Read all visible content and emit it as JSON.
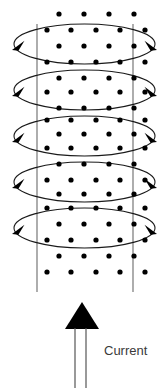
{
  "figure": {
    "background_color": "#ffffff",
    "width": 164,
    "height": 388
  },
  "labels": {
    "current": "Current"
  },
  "colors": {
    "coil_stroke": "#1a1a1a",
    "side_line": "#6b6b6b",
    "dot_fill": "#000000",
    "arrow_fill": "#000000",
    "current_shaft": "#555555",
    "label_text": "#3a3a3a"
  },
  "solenoid": {
    "loop_count": 5,
    "ellipse_center_x": 84.5,
    "ellipse_rx": 70.5,
    "ellipse_ry": 20,
    "loop_center_ys": [
      44,
      90,
      136,
      182,
      228
    ],
    "left_vertical_line_x": 37,
    "right_vertical_line_x": 133,
    "vertical_line_top_y": 24,
    "vertical_line_bottom_y": 292
  },
  "arrowheads": {
    "left_direction": "down-left",
    "right_direction": "down-right",
    "size": 11,
    "description": "Each coil loop carries one arrowhead on its left edge and one on its right edge indicating current circulation direction"
  },
  "field_dots": {
    "meaning": "magnetic field out of the page",
    "radius": 2.6,
    "rows": [
      {
        "y": 14,
        "xs": [
          59,
          84,
          109,
          134
        ]
      },
      {
        "y": 30,
        "xs": [
          47,
          71,
          96,
          120,
          145
        ]
      },
      {
        "y": 46,
        "xs": [
          59,
          84,
          109,
          134
        ]
      },
      {
        "y": 62,
        "xs": [
          47,
          71,
          96,
          120,
          145
        ]
      },
      {
        "y": 78,
        "xs": [
          59,
          84,
          109,
          134
        ]
      },
      {
        "y": 92,
        "xs": [
          47,
          71,
          96,
          120,
          145
        ]
      },
      {
        "y": 108,
        "xs": [
          59,
          84,
          109,
          134
        ]
      },
      {
        "y": 120,
        "xs": [
          47,
          71,
          96,
          120,
          145
        ]
      },
      {
        "y": 134,
        "xs": [
          59,
          84,
          109,
          134
        ]
      },
      {
        "y": 148,
        "xs": [
          47,
          71,
          96,
          120,
          145
        ]
      },
      {
        "y": 164,
        "xs": [
          59,
          84,
          109,
          134
        ]
      },
      {
        "y": 180,
        "xs": [
          47,
          71,
          96,
          120,
          145
        ]
      },
      {
        "y": 194,
        "xs": [
          59,
          84,
          109,
          134
        ]
      },
      {
        "y": 208,
        "xs": [
          47,
          71,
          96,
          120,
          145
        ]
      },
      {
        "y": 224,
        "xs": [
          59,
          84,
          109,
          134
        ]
      },
      {
        "y": 240,
        "xs": [
          47,
          71,
          96,
          120,
          145
        ]
      },
      {
        "y": 256,
        "xs": [
          59,
          84,
          109,
          134
        ]
      },
      {
        "y": 272,
        "xs": [
          47,
          71,
          96,
          120,
          145
        ]
      }
    ]
  },
  "current_arrow": {
    "label": "Current",
    "direction": "up",
    "head_apex": {
      "x": 82,
      "y": 302
    },
    "head_left": {
      "x": 65,
      "y": 329
    },
    "head_right": {
      "x": 99,
      "y": 329
    },
    "shaft_x_left": 75,
    "shaft_x_right": 86,
    "shaft_top_y": 328,
    "shaft_bottom_y": 388,
    "label_position": {
      "x": 104,
      "y": 355
    }
  }
}
